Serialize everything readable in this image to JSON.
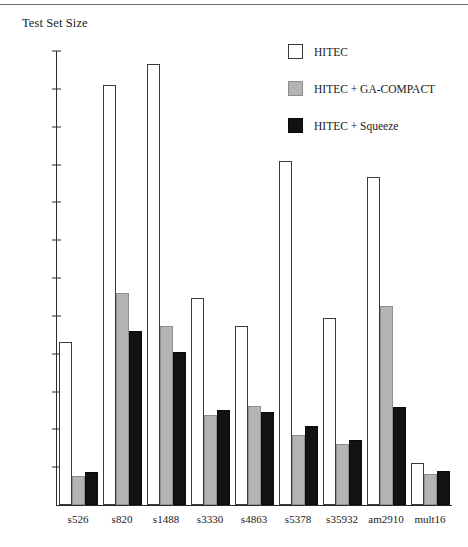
{
  "chart_data": {
    "type": "bar",
    "title": "Test Set Size",
    "xlabel": "",
    "ylabel": "Test Set Size",
    "ylim": [
      0,
      1200
    ],
    "yticks": [
      100,
      200,
      300,
      400,
      500,
      600,
      700,
      800,
      900,
      1000,
      1100,
      1200
    ],
    "grid": false,
    "legend_position": "top-right",
    "categories": [
      "s526",
      "s820",
      "s1488",
      "s3330",
      "s4863",
      "s5378",
      "s35932",
      "am2910",
      "mult16"
    ],
    "series": [
      {
        "name": "HITEC",
        "color": "#ffffff",
        "values": [
          430,
          1110,
          1165,
          548,
          473,
          910,
          493,
          868,
          110
        ]
      },
      {
        "name": "HITEC + GA-COMPACT",
        "color": "#b4b4b4",
        "values": [
          78,
          560,
          474,
          238,
          263,
          185,
          160,
          527,
          82
        ]
      },
      {
        "name": "HITEC + Squeeze",
        "color": "#121212",
        "values": [
          88,
          460,
          405,
          252,
          247,
          208,
          172,
          258,
          90
        ]
      }
    ]
  },
  "legend": {
    "entries": [
      {
        "label": "HITEC",
        "swatch": "white"
      },
      {
        "label": "HITEC + GA-COMPACT",
        "swatch": "gray"
      },
      {
        "label": "HITEC + Squeeze",
        "swatch": "black"
      }
    ]
  }
}
